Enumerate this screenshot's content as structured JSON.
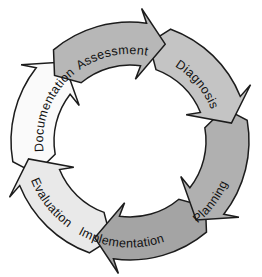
{
  "diagram": {
    "type": "cycle",
    "flow": "clockwise",
    "background": "#ffffff",
    "outline_color": "#1c1c1c",
    "label_color": "#111111",
    "steps": [
      {
        "label": "Assessment",
        "fill": "#b7b7b7"
      },
      {
        "label": "Diagnosis",
        "fill": "#c4c4c4"
      },
      {
        "label": "Planning",
        "fill": "#b0b0b0"
      },
      {
        "label": "Implementation",
        "fill": "#a4a4a4"
      },
      {
        "label": "Evaluation",
        "fill": "#e9e9e9"
      },
      {
        "label": "Documentation",
        "fill": "#fafafa"
      }
    ]
  }
}
